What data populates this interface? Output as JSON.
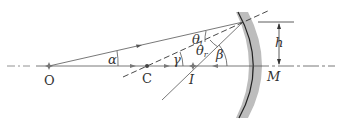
{
  "figure": {
    "colors": {
      "line": "#555555",
      "mirror_edge": "#222222",
      "mirror_fill": "#bdbdbd",
      "text": "#333333"
    }
  },
  "labels": {
    "object": "O",
    "center": "C",
    "image": "I",
    "vertex": "M",
    "height": "h",
    "alpha": "α",
    "beta": "β",
    "gamma": "γ",
    "theta": "θ",
    "theta_i_sub": "i",
    "theta_r_sub": "r"
  },
  "points": {
    "O": [
      49,
      66
    ],
    "C": [
      147,
      66
    ],
    "I": [
      193,
      66
    ],
    "M": [
      253,
      66
    ],
    "P": [
      243,
      22
    ]
  }
}
